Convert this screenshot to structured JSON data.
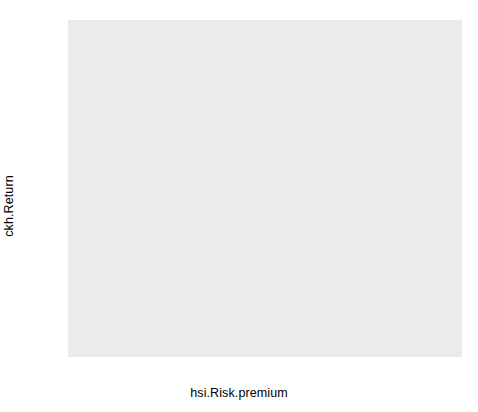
{
  "chart_data": {
    "type": "scatter",
    "title": "",
    "subtitle": "",
    "xlabel": "hsi.Risk.premium",
    "ylabel": "ckh.Return",
    "xlim": [
      -0.1385,
      0.1335
    ],
    "ylim": [
      -0.1125,
      0.1305
    ],
    "xticks": [
      -0.1,
      -0.05,
      0.0,
      0.05,
      0.1
    ],
    "xtick_labels": [
      "-0.10",
      "-0.05",
      "0.00",
      "0.05",
      "0.10"
    ],
    "yticks": [
      0.1,
      0.05,
      0.0,
      -0.05,
      -0.1
    ],
    "ytick_labels": [
      "0.10",
      "0.05",
      "0.00",
      "-0.05",
      "-0.10"
    ],
    "grid": true,
    "grid_color": "#ffffff",
    "panel_background": "#ebebeb",
    "legend": null,
    "point_shape": "open-circle",
    "point_color": "#1a1a1a",
    "point_fill": "none",
    "x": [
      -0.129,
      -0.11,
      -0.071,
      -0.053,
      -0.046,
      -0.04,
      -0.035,
      -0.031,
      -0.025,
      -0.011,
      0.077,
      0.077,
      0.12
    ],
    "y": [
      -0.1,
      -0.078,
      0.012,
      -0.056,
      -0.022,
      -0.043,
      0.006,
      -0.025,
      0.004,
      0.031,
      0.072,
      0.064,
      0.063
    ],
    "points": [
      {
        "x": -0.129,
        "y": -0.1
      },
      {
        "x": -0.11,
        "y": -0.078
      },
      {
        "x": -0.071,
        "y": 0.012
      },
      {
        "x": -0.053,
        "y": -0.056
      },
      {
        "x": -0.046,
        "y": -0.022
      },
      {
        "x": -0.04,
        "y": -0.043
      },
      {
        "x": -0.035,
        "y": 0.006
      },
      {
        "x": -0.031,
        "y": -0.025
      },
      {
        "x": -0.025,
        "y": 0.004
      },
      {
        "x": -0.011,
        "y": 0.031
      },
      {
        "x": 0.077,
        "y": 0.072
      },
      {
        "x": 0.077,
        "y": 0.064
      },
      {
        "x": 0.12,
        "y": 0.063
      }
    ],
    "fit": {
      "type": "linear-regression",
      "line_color": "#3b3b3b",
      "line_width": 2,
      "slope": 0.697,
      "intercept": -0.0097,
      "x_start": -0.133,
      "x_end": 0.125,
      "y_start": -0.1024,
      "y_end": 0.0774
    },
    "confidence_band": {
      "label": "95% confidence interval",
      "fill_color": "#a6a6a6",
      "opacity": 0.72,
      "x": [
        -0.133,
        -0.105,
        -0.075,
        -0.045,
        -0.015,
        0.015,
        0.045,
        0.075,
        0.105,
        0.125
      ],
      "upper": [
        -0.0742,
        -0.0501,
        -0.0253,
        -0.0013,
        0.0229,
        0.0479,
        0.0748,
        0.1042,
        0.1359,
        0.1582
      ],
      "lower": [
        -0.1306,
        -0.1058,
        -0.0795,
        -0.0546,
        -0.0306,
        -0.0072,
        0.0152,
        0.0368,
        0.0571,
        0.07
      ]
    }
  },
  "axes": {
    "y_title": "ckh.Return",
    "x_title": "hsi.Risk.premium",
    "y_tick_labels": [
      "0.10",
      "0.05",
      "0.00",
      "-0.05",
      "-0.10"
    ],
    "x_tick_labels": [
      "-0.10",
      "-0.05",
      "0.00",
      "0.05",
      "0.10"
    ]
  }
}
